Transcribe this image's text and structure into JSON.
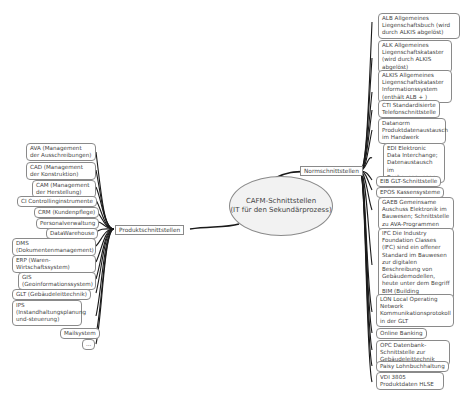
{
  "center": {
    "line1": "CAFM-Schnittstellen",
    "line2": "(IT für den Sekundärprozess)"
  },
  "branches": {
    "norm": {
      "label": "Normschnittstellen"
    },
    "produkt": {
      "label": "Produktschnittstellen"
    }
  },
  "norm_items": [
    "ALB Allgemeines Liegenschaftsbuch (wird durch ALKIS abgelöst)",
    "ALK Allgemeines Liegenschaftskataster (wird durch ALKIS abgelöst)",
    "ALKIS Allgemeines Liegenschaftskataster Informationssystem (enthält ALB + )",
    "CTI Standardisierte Telefonschnittstelle",
    "Datanorm Produktdatenaustausch im Handwerk",
    "EDI Elektronic Data Interchange; Datenaustausch im Rechnungswesen",
    "EIB GLT-Schnittstelle",
    "EPOS Kassensysteme",
    "GAEB Gemeinsame Auschuss Elektronik im Bauwesen; Schnittstelle zu AVA-Programmen",
    "IFC Die Industry Foundation Classes (IFC) sind ein offener Standard im Bauwesen zur digitalen Beschreibung von Gebäudemodellen, heute unter dem Begriff BIM (Building Information Modeling) bekannt.",
    "LON Local Operating Network Kommunikationsprotokoll in der GLT",
    "Online Banking",
    "OPC Datenbank-Schnittstelle zur Gebäudeleittechnik",
    "Paisy Lohnbuchhaltung",
    "VDI 3805 Produktdaten HLSE"
  ],
  "produkt_items": [
    "AVA (Management der Ausschreibungen)",
    "CAD (Management der Konstruktion)",
    "CAM (Management der Herstellung)",
    "CI Controllinginstrumente",
    "CRM (Kundenpflege)",
    "Personalverwaltung",
    "DataWarehouse",
    "DMS (Dokumentenmanagement)",
    "ERP (Waren-Wirtschaftssystem)",
    "GIS (Geoinformationssystem)",
    "GLT (Gebäudeleittechnik)",
    "IPS (Instandhaltungsplanung und-steuerung)",
    "Mailsystem",
    "..."
  ]
}
